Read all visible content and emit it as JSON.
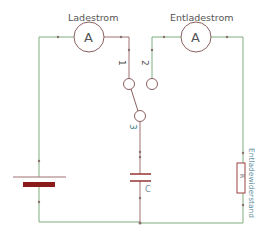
{
  "diagram": {
    "type": "circuit-schematic",
    "labels": {
      "ammeter_charge_label": "Ladestrom",
      "ammeter_discharge_label": "Entladestrom",
      "ammeter_symbol": "A",
      "contact_1": "1",
      "contact_2": "2",
      "contact_3": "3",
      "capacitor": "C",
      "resistor": "Entladewiderstand",
      "resistor_symbol": "R"
    },
    "colors": {
      "wire_green": "#7fae7f",
      "wire_brown": "#a07070",
      "component": "#9b4040",
      "battery_plate": "#8b1a1a",
      "label_text": "#555555",
      "number_text": "#3f7f8f"
    },
    "components": [
      {
        "id": "battery",
        "kind": "battery"
      },
      {
        "id": "ammeter-charge",
        "kind": "ammeter",
        "label": "Ladestrom"
      },
      {
        "id": "ammeter-discharge",
        "kind": "ammeter",
        "label": "Entladestrom"
      },
      {
        "id": "switch",
        "kind": "changeover-switch",
        "contacts": [
          "1",
          "2",
          "3"
        ]
      },
      {
        "id": "capacitor",
        "kind": "capacitor",
        "label": "C"
      },
      {
        "id": "resistor",
        "kind": "resistor",
        "label": "Entladewiderstand"
      }
    ]
  }
}
